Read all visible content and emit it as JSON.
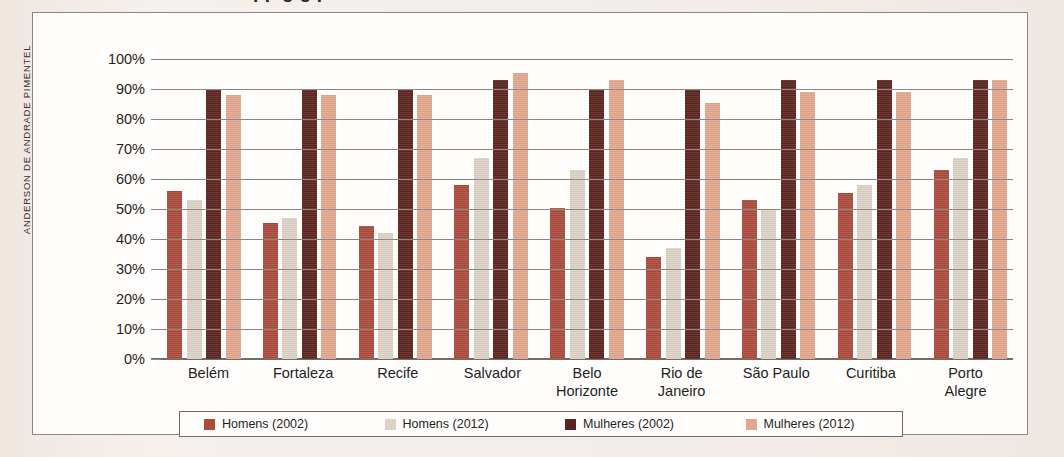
{
  "credit": "ANDERSON DE ANDRADE PIMENTEL",
  "title_fragment": "pp g       g        p",
  "chart_data": {
    "type": "bar",
    "title": "",
    "xlabel": "",
    "ylabel": "",
    "ylim": [
      0,
      100
    ],
    "grid": true,
    "legend_position": "bottom",
    "categories": [
      "Belém",
      "Fortaleza",
      "Recife",
      "Salvador",
      "Belo Horizonte",
      "Rio de Janeiro",
      "São Paulo",
      "Curitiba",
      "Porto Alegre"
    ],
    "category_lines": [
      [
        "Belém"
      ],
      [
        "Fortaleza"
      ],
      [
        "Recife"
      ],
      [
        "Salvador"
      ],
      [
        "Belo",
        "Horizonte"
      ],
      [
        "Rio de",
        "Janeiro"
      ],
      [
        "São Paulo"
      ],
      [
        "Curitiba"
      ],
      [
        "Porto",
        "Alegre"
      ]
    ],
    "ticks": [
      "100%",
      "90%",
      "80%",
      "70%",
      "60%",
      "50%",
      "40%",
      "30%",
      "20%",
      "10%",
      "0%"
    ],
    "tick_values": [
      100,
      90,
      80,
      70,
      60,
      50,
      40,
      30,
      20,
      10,
      0
    ],
    "series": [
      {
        "name": "Homens (2002)",
        "color": "#ab4b3c",
        "values": [
          56,
          45.5,
          44.5,
          58,
          50.5,
          34,
          53,
          55.5,
          63
        ]
      },
      {
        "name": "Homens (2012)",
        "color": "#ded2c7",
        "values": [
          53,
          47,
          42,
          67,
          63,
          37,
          50,
          58,
          67
        ]
      },
      {
        "name": "Mulheres (2002)",
        "color": "#5c241f",
        "values": [
          90,
          90,
          90,
          93,
          90,
          90,
          93,
          93,
          93
        ]
      },
      {
        "name": "Mulheres (2012)",
        "color": "#e2a88e",
        "values": [
          88,
          88,
          88,
          95.5,
          93,
          85.5,
          89,
          89,
          93
        ]
      }
    ]
  }
}
